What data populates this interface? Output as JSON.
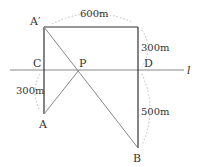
{
  "diagram": {
    "type": "geometry-reflection",
    "points": {
      "A_prime": {
        "label": "A′",
        "x": 44,
        "y": 27
      },
      "C": {
        "label": "C",
        "x": 44,
        "y": 70
      },
      "P": {
        "label": "P",
        "x": 79,
        "y": 70
      },
      "D": {
        "label": "D",
        "x": 138,
        "y": 70
      },
      "A": {
        "label": "A",
        "x": 44,
        "y": 114
      },
      "B": {
        "label": "B",
        "x": 138,
        "y": 148
      },
      "E": {
        "x": 138,
        "y": 27
      }
    },
    "line_name": "l",
    "distances": {
      "top": "600m",
      "right_upper": "300m",
      "left_lower": "300m",
      "right_lower": "500m"
    },
    "colors": {
      "stroke_dark": "#333333",
      "stroke_gray": "#888888",
      "arc_dotted": "#bbbbbb"
    }
  }
}
